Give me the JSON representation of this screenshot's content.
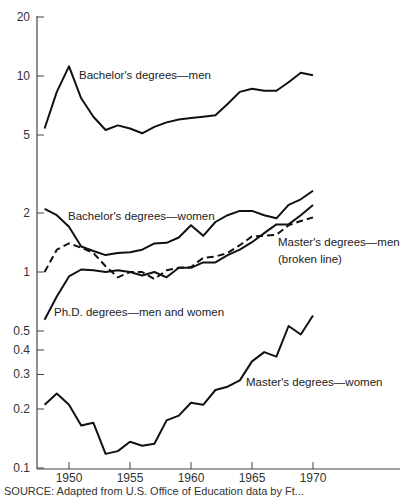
{
  "chart_data": {
    "type": "line",
    "title": "",
    "xlabel": "",
    "ylabel": "",
    "yscale": "log",
    "ylim": [
      0.1,
      20
    ],
    "xlim": [
      1948,
      1970
    ],
    "grid": false,
    "legend_position": "inline labels",
    "y_ticks": [
      {
        "value": 20,
        "label": "20"
      },
      {
        "value": 10,
        "label": "10"
      },
      {
        "value": 5,
        "label": "5"
      },
      {
        "value": 2,
        "label": "2"
      },
      {
        "value": 1,
        "label": "1"
      },
      {
        "value": 0.5,
        "label": "0.5"
      },
      {
        "value": 0.4,
        "label": "0.4"
      },
      {
        "value": 0.3,
        "label": "0.3"
      },
      {
        "value": 0.2,
        "label": "0.2"
      },
      {
        "value": 0.1,
        "label": "0.1"
      }
    ],
    "x_ticks": [
      {
        "value": 1950,
        "label": "1950"
      },
      {
        "value": 1955,
        "label": "1955"
      },
      {
        "value": 1960,
        "label": "1960"
      },
      {
        "value": 1965,
        "label": "1965"
      },
      {
        "value": 1970,
        "label": "1970"
      }
    ],
    "x": [
      1948,
      1949,
      1950,
      1951,
      1952,
      1953,
      1954,
      1955,
      1956,
      1957,
      1958,
      1959,
      1960,
      1961,
      1962,
      1963,
      1964,
      1965,
      1966,
      1967,
      1968,
      1969,
      1970
    ],
    "series": [
      {
        "name": "Bachelor's degrees—men",
        "style": "solid",
        "values": [
          5.4,
          8.3,
          11.2,
          7.7,
          6.2,
          5.3,
          5.6,
          5.4,
          5.1,
          5.5,
          5.8,
          6.0,
          6.1,
          6.2,
          6.3,
          7.2,
          8.3,
          8.6,
          8.4,
          8.4,
          9.3,
          10.4,
          10.1
        ]
      },
      {
        "name": "Bachelor's degrees—women",
        "style": "solid",
        "values": [
          2.1,
          1.95,
          1.7,
          1.35,
          1.28,
          1.22,
          1.25,
          1.26,
          1.3,
          1.4,
          1.41,
          1.5,
          1.73,
          1.53,
          1.8,
          1.95,
          2.05,
          2.05,
          1.95,
          1.88,
          2.2,
          2.35,
          2.6
        ]
      },
      {
        "name": "Master's degrees—men (broken line)",
        "style": "dashed",
        "values": [
          1.0,
          1.3,
          1.4,
          1.33,
          1.25,
          1.07,
          0.94,
          1.0,
          1.0,
          0.92,
          1.02,
          1.05,
          1.06,
          1.18,
          1.2,
          1.25,
          1.37,
          1.52,
          1.53,
          1.55,
          1.73,
          1.82,
          1.9
        ]
      },
      {
        "name": "Ph.D. degrees—men and women",
        "style": "solid",
        "values": [
          0.57,
          0.75,
          0.95,
          1.03,
          1.02,
          1.0,
          1.02,
          1.0,
          0.96,
          1.0,
          0.94,
          1.05,
          1.05,
          1.12,
          1.12,
          1.22,
          1.3,
          1.42,
          1.58,
          1.75,
          1.75,
          1.95,
          2.2
        ]
      },
      {
        "name": "Master's degrees—women",
        "style": "solid",
        "values": [
          0.21,
          0.24,
          0.21,
          0.165,
          0.17,
          0.118,
          0.122,
          0.136,
          0.13,
          0.133,
          0.175,
          0.185,
          0.215,
          0.21,
          0.25,
          0.26,
          0.28,
          0.35,
          0.39,
          0.37,
          0.53,
          0.48,
          0.6
        ]
      }
    ],
    "annotations": [
      {
        "text": "Bachelor's degrees—men",
        "x": 79,
        "y": 70
      },
      {
        "text": "Bachelor's degrees—women",
        "x": 68,
        "y": 211
      },
      {
        "text": "Master's degrees—men",
        "x": 278,
        "y": 237
      },
      {
        "text": "(broken line)",
        "x": 278,
        "y": 254
      },
      {
        "text": "Ph.D. degrees—men and women",
        "x": 54,
        "y": 307
      },
      {
        "text": "Master's degrees—women",
        "x": 246,
        "y": 377
      }
    ]
  },
  "caption": "SOURCE: Adapted from U.S. Office of Education data by Ft..."
}
